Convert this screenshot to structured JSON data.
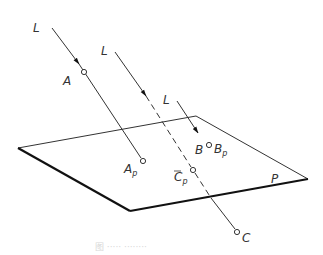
{
  "diagram": {
    "plane": {
      "label": "P"
    },
    "lines": [
      {
        "label": "L",
        "point": "A",
        "projection": "A",
        "projection_sub": "p"
      },
      {
        "label": "L",
        "point": "C",
        "projection": "C",
        "projection_sub": "p"
      },
      {
        "label": "L",
        "point": "B",
        "projection": "B",
        "projection_sub": "p"
      }
    ],
    "caption": "图 ····· ········"
  }
}
